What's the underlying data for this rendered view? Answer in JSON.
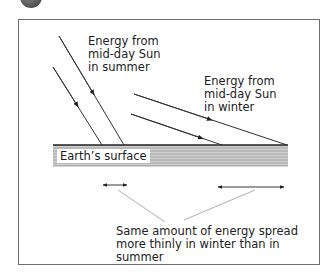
{
  "figure": {
    "badge": "dark-circle-badge",
    "labels": {
      "summer": "Energy from\nmid-day Sun\nin summer",
      "winter": "Energy from\nmid-day Sun\nin winter",
      "surface": "Earth’s surface",
      "caption": "Same amount of energy spread\nmore thinly in winter than in summer"
    },
    "colors": {
      "frame": "#6e6e6e",
      "surface_fill": "#b4b4b4",
      "surface_stripe": "#c8c8c8",
      "ray": "#333333",
      "pointer": "#9a9a9a"
    },
    "rays": {
      "summer": [
        {
          "from": [
            59,
            36
          ],
          "to": [
            124,
            145
          ]
        },
        {
          "from": [
            53,
            67
          ],
          "to": [
            102,
            145
          ]
        }
      ],
      "winter": [
        {
          "from": [
            134,
            94
          ],
          "to": [
            287,
            145
          ]
        },
        {
          "from": [
            131,
            114
          ],
          "to": [
            222,
            145
          ]
        }
      ]
    },
    "spread_markers": {
      "summer": {
        "x1": 102,
        "x2": 128,
        "y": 185
      },
      "winter": {
        "x1": 217,
        "x2": 285,
        "y": 187
      }
    }
  }
}
